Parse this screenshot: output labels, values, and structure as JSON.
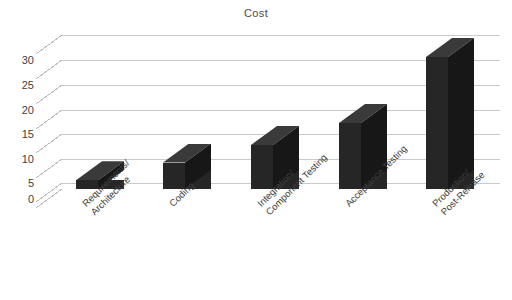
{
  "chart_data": {
    "type": "bar",
    "title": "Cost",
    "xlabel": "",
    "ylabel": "",
    "categories": [
      "Requirements/\nArchitecture",
      "Coding",
      "Integration/\nComponent Testing",
      "Acceptance Testing",
      "Production/\nPost-Release"
    ],
    "values": [
      2,
      6,
      10,
      15,
      30
    ],
    "ylim": [
      0,
      35
    ],
    "yticks": [
      0,
      5,
      10,
      15,
      20,
      25,
      30
    ],
    "ytick_labels": [
      "0",
      "5",
      "10",
      "15",
      "20",
      "25",
      "30"
    ],
    "grid": true,
    "legend": "none",
    "style": "3d-column",
    "bar_color": "#262626",
    "bar_side_color": "#171717",
    "bar_top_color": "#3a3a3a",
    "grid_color": "#c9c9c9",
    "background": "#ffffff"
  }
}
